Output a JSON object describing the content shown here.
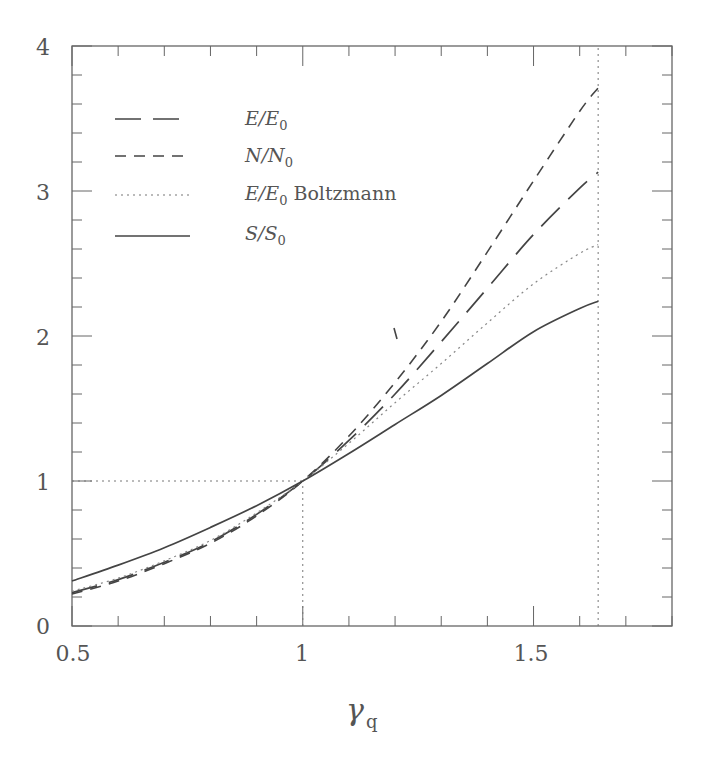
{
  "chart_data": {
    "type": "line",
    "title": "",
    "xlabel": "γ_q",
    "ylabel": "",
    "xlim": [
      0.5,
      1.8
    ],
    "ylim": [
      0,
      4
    ],
    "x_ticks": [
      0.5,
      1,
      1.5
    ],
    "x_tick_labels": [
      "0.5",
      "1",
      "1.5"
    ],
    "x_minor_step": 0.1,
    "y_ticks": [
      0,
      1,
      2,
      3,
      4
    ],
    "y_tick_labels": [
      "0",
      "1",
      "2",
      "3",
      "4"
    ],
    "y_minor_step": 0.2,
    "grid": false,
    "legend_position": "upper left",
    "reference_lines": [
      {
        "type": "horizontal",
        "y": 1,
        "x_range": [
          0.5,
          1
        ],
        "style": "dotted"
      },
      {
        "type": "vertical",
        "x": 1,
        "y_range": [
          0,
          1
        ],
        "style": "dotted"
      },
      {
        "type": "vertical",
        "x": 1.64,
        "y_range": [
          0,
          4
        ],
        "style": "dotted"
      }
    ],
    "x": [
      0.5,
      0.6,
      0.7,
      0.8,
      0.9,
      1.0,
      1.1,
      1.2,
      1.3,
      1.4,
      1.5,
      1.6,
      1.64
    ],
    "series": [
      {
        "name": "E/E0",
        "style": "long-dash",
        "values": [
          0.23,
          0.32,
          0.44,
          0.58,
          0.77,
          1.0,
          1.28,
          1.6,
          1.96,
          2.33,
          2.7,
          3.02,
          3.13
        ]
      },
      {
        "name": "N/N0",
        "style": "short-dash",
        "values": [
          0.22,
          0.31,
          0.43,
          0.57,
          0.76,
          1.0,
          1.31,
          1.68,
          2.1,
          2.58,
          3.07,
          3.55,
          3.71
        ]
      },
      {
        "name": "E/E0 Boltzmann",
        "style": "dotted",
        "values": [
          0.24,
          0.33,
          0.45,
          0.59,
          0.78,
          1.0,
          1.26,
          1.54,
          1.81,
          2.09,
          2.36,
          2.57,
          2.63
        ]
      },
      {
        "name": "S/S0",
        "style": "solid",
        "values": [
          0.31,
          0.42,
          0.54,
          0.68,
          0.83,
          1.0,
          1.19,
          1.39,
          1.59,
          1.81,
          2.03,
          2.19,
          2.24
        ]
      }
    ]
  },
  "legend": {
    "items": [
      {
        "label_main": "E/E",
        "label_sub": "0",
        "label_suffix": ""
      },
      {
        "label_main": "N/N",
        "label_sub": "0",
        "label_suffix": ""
      },
      {
        "label_main": "E/E",
        "label_sub": "0",
        "label_suffix": " Boltzmann"
      },
      {
        "label_main": "S/S",
        "label_sub": "0",
        "label_suffix": ""
      }
    ]
  },
  "axes": {
    "x_title_main": "γ",
    "x_title_sub": "q",
    "x_tick_labels": [
      "0.5",
      "1",
      "1.5"
    ],
    "y_tick_labels": [
      "0",
      "1",
      "2",
      "3",
      "4"
    ]
  },
  "colors": {
    "line": "#444444",
    "frame": "#666666",
    "text": "#555555",
    "background": "#ffffff"
  }
}
